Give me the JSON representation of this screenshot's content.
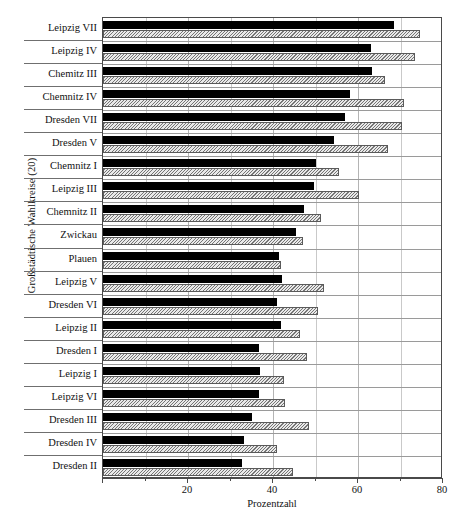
{
  "chart_data": {
    "type": "bar",
    "orientation": "horizontal",
    "title": "",
    "xlabel": "Prozentzahl",
    "ylabel": "Großstädtische Wahlkreise (20)",
    "xlim": [
      0,
      80
    ],
    "xticks": [
      20,
      40,
      60,
      80
    ],
    "xminorticks": [
      10,
      30,
      50,
      70
    ],
    "grid": true,
    "legend": null,
    "categories": [
      "Leipzig VII",
      "Leipzig IV",
      "Chemitz III",
      "Chemnitz IV",
      "Dresden VII",
      "Dresden V",
      "Chemnitz I",
      "Leipzig III",
      "Chemnitz II",
      "Zwickau",
      "Plauen",
      "Leipzig V",
      "Dresden VI",
      "Leipzig II",
      "Dresden I",
      "Leipzig I",
      "Leipzig VI",
      "Dresden III",
      "Dresden IV",
      "Dresden II"
    ],
    "series": [
      {
        "name": "dark",
        "style": "solid-black",
        "color": "#000000",
        "values": [
          68.4,
          63.0,
          63.3,
          58.0,
          57.0,
          54.4,
          50.1,
          49.7,
          47.4,
          45.4,
          41.3,
          42.0,
          40.9,
          41.9,
          36.6,
          36.9,
          36.8,
          35.1,
          33.1,
          32.7
        ]
      },
      {
        "name": "hatched",
        "style": "hatched-grey",
        "color": "#e9e9e9",
        "values": [
          74.7,
          73.4,
          66.4,
          70.8,
          70.4,
          67.1,
          55.6,
          60.3,
          51.2,
          47.0,
          41.9,
          52.0,
          50.5,
          46.4,
          48.0,
          42.5,
          42.8,
          48.5,
          40.9,
          44.7
        ]
      }
    ]
  }
}
